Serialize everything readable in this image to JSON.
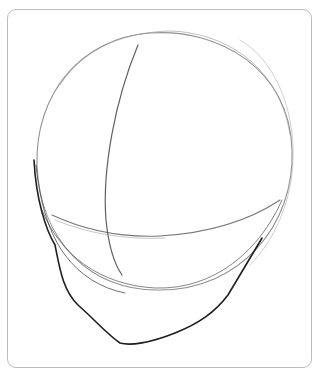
{
  "image": {
    "description": "Pencil sketch of a head construction: cranial circle with vertical and horizontal guidelines and a jaw outline, inside a rounded frame",
    "colors": {
      "frame": "#bdbdbd",
      "light_stroke": "#8a8a8a",
      "dark_stroke": "#1e1e1e",
      "background": "#ffffff"
    }
  }
}
